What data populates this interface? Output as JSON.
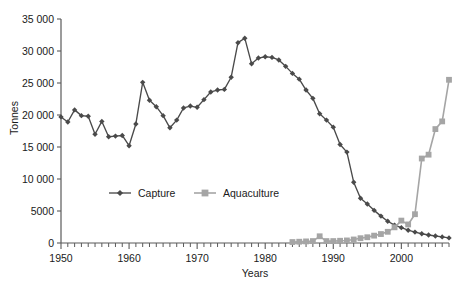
{
  "chart_data": {
    "type": "line",
    "title": "",
    "xlabel": "Years",
    "ylabel": "Tonnes",
    "xlim": [
      1950,
      2007
    ],
    "ylim": [
      0,
      35000
    ],
    "grid": false,
    "legend_position": "center-inside",
    "y_ticks": [
      0,
      5000,
      10000,
      15000,
      20000,
      25000,
      30000,
      35000
    ],
    "y_ticklabels": [
      "0",
      "5000",
      "10 000",
      "15 000",
      "20 000",
      "25 000",
      "30 000",
      "35 000"
    ],
    "x_ticks": [
      1950,
      1960,
      1970,
      1980,
      1990,
      2000
    ],
    "x_ticklabels": [
      "1950",
      "1960",
      "1970",
      "1980",
      "1990",
      "2000"
    ],
    "x_minor_tick_step": 1,
    "x": [
      1950,
      1951,
      1952,
      1953,
      1954,
      1955,
      1956,
      1957,
      1958,
      1959,
      1960,
      1961,
      1962,
      1963,
      1964,
      1965,
      1966,
      1967,
      1968,
      1969,
      1970,
      1971,
      1972,
      1973,
      1974,
      1975,
      1976,
      1977,
      1978,
      1979,
      1980,
      1981,
      1982,
      1983,
      1984,
      1985,
      1986,
      1987,
      1988,
      1989,
      1990,
      1991,
      1992,
      1993,
      1994,
      1995,
      1996,
      1997,
      1998,
      1999,
      2000,
      2001,
      2002,
      2003,
      2004,
      2005,
      2006,
      2007
    ],
    "series": [
      {
        "name": "Capture",
        "color": "#4a4a4a",
        "marker": "diamond",
        "values": [
          19700,
          18900,
          20800,
          19900,
          19800,
          17000,
          19000,
          16600,
          16700,
          16800,
          15200,
          18600,
          25100,
          22300,
          21300,
          19900,
          18000,
          19200,
          21100,
          21400,
          21200,
          22400,
          23600,
          23900,
          24000,
          25900,
          31300,
          32000,
          28000,
          28900,
          29100,
          29000,
          28600,
          27600,
          26500,
          25600,
          23900,
          22600,
          20200,
          19200,
          18100,
          15400,
          14200,
          9500,
          7000,
          6100,
          5100,
          4200,
          3400,
          2800,
          2400,
          2000,
          1700,
          1450,
          1250,
          1100,
          950,
          800
        ]
      },
      {
        "name": "Aquaculture",
        "color": "#a5a5a5",
        "marker": "square",
        "values": [
          null,
          null,
          null,
          null,
          null,
          null,
          null,
          null,
          null,
          null,
          null,
          null,
          null,
          null,
          null,
          null,
          null,
          null,
          null,
          null,
          null,
          null,
          null,
          null,
          null,
          null,
          null,
          null,
          null,
          null,
          null,
          null,
          null,
          null,
          150,
          200,
          250,
          300,
          1050,
          300,
          300,
          350,
          400,
          550,
          750,
          900,
          1150,
          1400,
          1750,
          2450,
          3500,
          2900,
          4500,
          13200,
          13800,
          17800,
          19000,
          25500
        ]
      }
    ]
  },
  "legend": {
    "items": [
      {
        "label": "Capture",
        "marker": "diamond",
        "color": "#4a4a4a"
      },
      {
        "label": "Aquaculture",
        "marker": "square",
        "color": "#a5a5a5"
      }
    ]
  },
  "axes": {
    "y_title": "Tonnes",
    "x_title": "Years"
  },
  "caption": {
    "text": ""
  }
}
